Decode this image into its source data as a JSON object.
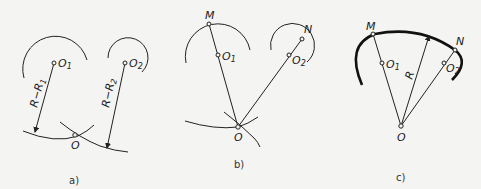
{
  "figure": {
    "panels": [
      {
        "caption": "a)",
        "labels": {
          "o1": "O",
          "o1_sub": "1",
          "o2": "O",
          "o2_sub": "2",
          "o": "O",
          "r1": "R−R",
          "r1_sub": "1",
          "r2": "R−R",
          "r2_sub": "2"
        }
      },
      {
        "caption": "b)",
        "labels": {
          "m": "M",
          "n": "N",
          "o1": "O",
          "o1_sub": "1",
          "o2": "O",
          "o2_sub": "2",
          "o": "O"
        }
      },
      {
        "caption": "c)",
        "labels": {
          "m": "M",
          "n": "N",
          "o1": "O",
          "o1_sub": "1",
          "o2": "O",
          "o2_sub": "2",
          "o": "O",
          "r": "R"
        }
      }
    ]
  }
}
